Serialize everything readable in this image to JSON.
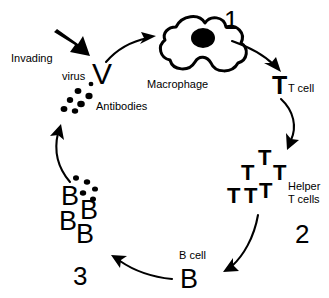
{
  "diagram": {
    "background_color": "#ffffff",
    "ink_color": "#000000",
    "labels": {
      "invading": "Invading",
      "virus": "virus",
      "antibodies": "Antibodies",
      "macrophage": "Macrophage",
      "t_cell": "T cell",
      "helper_line1": "Helper",
      "helper_line2": "T cells",
      "b_cell": "B cell"
    },
    "steps": {
      "one": "1",
      "two": "2",
      "three": "3"
    },
    "glyphs": {
      "virus_v": "V",
      "t_cell_single": "T",
      "helper_t": "T",
      "b_cell_single": "B",
      "b_clone": "B"
    },
    "counts": {
      "helper_t_cells": 6,
      "b_cell_clones": 5,
      "antibody_dots_top": 7,
      "antibody_dots_b_cluster": 5
    },
    "nodes": [
      {
        "name": "invading-virus",
        "label": "Invading virus",
        "glyph": "V"
      },
      {
        "name": "macrophage",
        "label": "Macrophage",
        "glyph": "blob"
      },
      {
        "name": "t-cell",
        "label": "T cell",
        "glyph": "T"
      },
      {
        "name": "helper-t-cells",
        "label": "Helper T cells",
        "glyph": "T"
      },
      {
        "name": "b-cell",
        "label": "B cell",
        "glyph": "B"
      },
      {
        "name": "b-cell-clones",
        "label": "Antibodies",
        "glyph": "B"
      }
    ]
  }
}
